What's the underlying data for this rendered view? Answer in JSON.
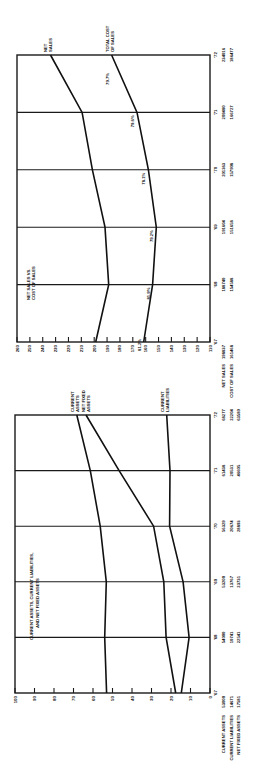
{
  "chart_data": [
    {
      "type": "line",
      "title": "NET SALES VS. COST OF SALES",
      "orientation": "rotated-90",
      "categories": [
        "'67",
        "'68",
        "'69",
        "'70",
        "'71",
        "'72"
      ],
      "ylim": [
        110,
        260
      ],
      "yticks": [
        110,
        120,
        130,
        140,
        150,
        160,
        170,
        180,
        190,
        200,
        210,
        220,
        230,
        240,
        250,
        260
      ],
      "series": [
        {
          "name": "NET SALES",
          "values": [
            198.8,
            188.7,
            191.6,
            201.4,
            209.4,
            234.0
          ],
          "row_label": "NET SALES",
          "row_values": [
            "198837",
            "188740",
            "191604",
            "201363",
            "209480",
            "234016"
          ]
        },
        {
          "name": "TOTAL COST OF SALES",
          "values": [
            161.5,
            154.6,
            151.7,
            157.9,
            166.7,
            186.5
          ],
          "row_label": "COST OF SALES",
          "row_values": [
            "161468",
            "154588",
            "151658",
            "157908",
            "166727",
            "186477"
          ]
        }
      ],
      "annotations": [
        "81.2%",
        "81.9%",
        "79.2%",
        "78.1%",
        "79.6%",
        "79.7%"
      ],
      "legend": [
        "NET SALES",
        "TOTAL COST OF SALES"
      ]
    },
    {
      "type": "line",
      "title": "CURRENT ASSETS, CURRENT LIABILITIES, AND NET FIXED ASSETS",
      "orientation": "rotated-90",
      "categories": [
        "'67",
        "'68",
        "'69",
        "'70",
        "'71",
        "'72"
      ],
      "ylim": [
        0,
        100
      ],
      "yticks": [
        0,
        10,
        20,
        30,
        40,
        50,
        60,
        70,
        80,
        90,
        100
      ],
      "series": [
        {
          "name": "CURRENT ASSETS",
          "values": [
            53.0,
            54.0,
            53.2,
            56.3,
            61.4,
            68.3
          ],
          "row_label": "CURRENT ASSETS",
          "row_values": [
            "53000",
            "54000",
            "53200",
            "56329",
            "61438",
            "68277"
          ]
        },
        {
          "name": "CURRENT LIABILITIES",
          "values": [
            14.7,
            10.7,
            13.8,
            20.7,
            20.5,
            22.2
          ],
          "row_label": "CURRENT LIABILITIES",
          "row_values": [
            "14671",
            "10741",
            "13767",
            "20674",
            "20531",
            "22204"
          ]
        },
        {
          "name": "NET FIXED ASSETS",
          "values": [
            17.6,
            22.5,
            23.7,
            28.9,
            46.6,
            63.6
          ],
          "row_label": "NET FIXED ASSETS",
          "row_values": [
            "17581",
            "22541",
            "23731",
            "28893",
            "46605",
            "63589"
          ]
        }
      ],
      "legend": [
        "CURRENT ASSETS",
        "NET FIXED ASSETS",
        "CURRENT LIABILITIES"
      ]
    }
  ]
}
